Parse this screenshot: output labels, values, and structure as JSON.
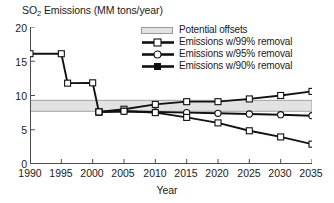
{
  "chart_data": {
    "type": "line",
    "title": "SO2 Emissions (MM tons/year)",
    "title_main": "SO",
    "title_sub": "2",
    "title_rest": " Emissions (MM tons/year)",
    "xlabel": "Year",
    "ylabel": "",
    "xlim": [
      1990,
      2035
    ],
    "ylim": [
      0,
      20
    ],
    "xticks": [
      1990,
      1995,
      2000,
      2005,
      2010,
      2015,
      2020,
      2025,
      2030,
      2035
    ],
    "yticks": [
      0,
      5,
      10,
      15,
      20
    ],
    "grid": false,
    "legend_position": "top-right",
    "band": {
      "label": "Potential offsets",
      "ymin": 7.7,
      "ymax": 9.3,
      "xmin": 1990,
      "xmax": 2035,
      "fill": "#e2e2e2",
      "edge": "#9a9a9a"
    },
    "historical": {
      "name": "Historical emissions",
      "marker": "square",
      "x": [
        1990,
        1995,
        1996,
        2000,
        2001
      ],
      "values": [
        16.1,
        16.1,
        11.8,
        11.85,
        7.6
      ]
    },
    "series": [
      {
        "name": "Emissions w/99% removal",
        "marker": "square",
        "x": [
          2001,
          2005,
          2010,
          2015,
          2020,
          2025,
          2030,
          2035
        ],
        "values": [
          7.6,
          8.0,
          8.7,
          9.1,
          9.1,
          9.5,
          10.0,
          10.6
        ]
      },
      {
        "name": "Emissions w/95% removal",
        "marker": "circle",
        "x": [
          2001,
          2005,
          2010,
          2015,
          2020,
          2025,
          2030,
          2035
        ],
        "values": [
          7.6,
          7.7,
          7.6,
          7.5,
          7.4,
          7.3,
          7.2,
          7.05
        ]
      },
      {
        "name": "Emissions w/90% removal",
        "marker": "square",
        "x": [
          2001,
          2005,
          2010,
          2015,
          2020,
          2025,
          2030,
          2035
        ],
        "values": [
          7.6,
          7.7,
          7.5,
          6.8,
          6.0,
          4.85,
          3.95,
          2.9
        ]
      }
    ],
    "legend": [
      {
        "label": "Potential offsets",
        "key": "band"
      },
      {
        "label": "Emissions w/99% removal",
        "key": "square"
      },
      {
        "label": "Emissions w/95% removal",
        "key": "circle"
      },
      {
        "label": "Emissions w/90% removal",
        "key": "square-filled"
      }
    ]
  },
  "ticks": {
    "y": [
      "20",
      "15",
      "10",
      "5",
      "0"
    ],
    "x": [
      "1990",
      "1995",
      "2000",
      "2005",
      "2010",
      "2015",
      "2020",
      "2025",
      "2030",
      "2035"
    ]
  },
  "axis": {
    "xlabel": "Year"
  },
  "colors": {
    "line": "#111111",
    "band_fill": "#e2e2e2",
    "band_edge": "#9a9a9a",
    "axis": "#4d4d4d",
    "text": "#1a1a1a"
  }
}
